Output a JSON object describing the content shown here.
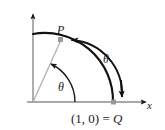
{
  "figure": {
    "type": "math-diagram",
    "background_color": "#ffffff",
    "axis_color": "#8c8c8c",
    "arc_color": "#111111",
    "radius_color": "#aaaaaa",
    "marker_color": "#9a9a9a",
    "text_color": "#1a1a1a",
    "labels": {
      "point_p": "P",
      "theta_inner": "θ",
      "theta_outer": "θ",
      "x_axis": "x",
      "point_q_coords": "(1, 0)",
      "point_q_equals": " = ",
      "point_q_name": "Q"
    },
    "geometry": {
      "origin_x": 33,
      "origin_y": 102,
      "radius": 80,
      "p_angle_degrees": 51,
      "q_label_value": "(1, 0)"
    }
  }
}
